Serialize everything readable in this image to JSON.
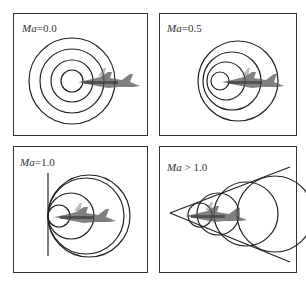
{
  "figure": {
    "panels": [
      {
        "id": "subsonic-still",
        "label_var": "Ma",
        "label_op": "=",
        "label_val": "0.0"
      },
      {
        "id": "subsonic-moving",
        "label_var": "Ma",
        "label_op": "=",
        "label_val": "0.5"
      },
      {
        "id": "sonic",
        "label_var": "Ma",
        "label_op": "=",
        "label_val": "1.0"
      },
      {
        "id": "supersonic",
        "label_var": "Ma",
        "label_op": " > ",
        "label_val": "1.0"
      }
    ]
  },
  "colors": {
    "line": "#222222",
    "aircraft": "#555555",
    "frame": "#333333"
  }
}
